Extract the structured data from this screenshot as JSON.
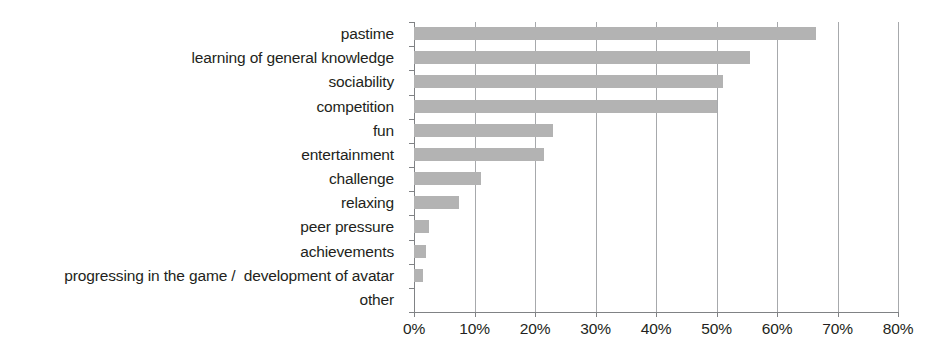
{
  "chart_data": {
    "type": "bar",
    "orientation": "horizontal",
    "title": "",
    "subtitle": "",
    "xlabel": "",
    "ylabel": "",
    "xlim": [
      0,
      80
    ],
    "xtick_labels": [
      "0%",
      "10%",
      "20%",
      "30%",
      "40%",
      "50%",
      "60%",
      "70%",
      "80%"
    ],
    "xtick_values": [
      0,
      10,
      20,
      30,
      40,
      50,
      60,
      70,
      80
    ],
    "grid": true,
    "grid_axis": "x",
    "legend": false,
    "legend_position": "none",
    "units": "%",
    "bar_color": "#b3b3b3",
    "axis_color": "#808285",
    "gridline_color": "#a7a9ac",
    "text_color": "#231f20",
    "categories": [
      "pastime",
      "learning of general knowledge",
      "sociability",
      "competition",
      "fun",
      "entertainment",
      "challenge",
      "relaxing",
      "peer pressure",
      "achievements",
      "progressing in the game /  development of avatar",
      "other"
    ],
    "values": [
      66.5,
      55.5,
      51,
      50,
      23,
      21.5,
      11,
      7.5,
      2.5,
      2,
      1.5,
      0
    ]
  }
}
